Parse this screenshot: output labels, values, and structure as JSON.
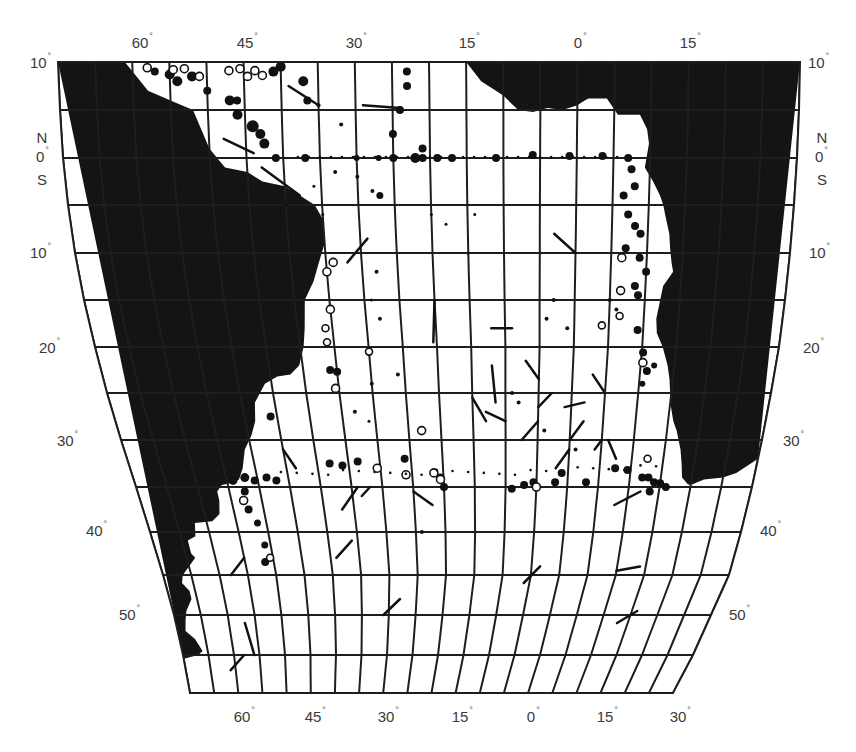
{
  "map": {
    "type": "Atlantic Ocean station map",
    "region": "South Atlantic (10°N to 60°S, 70°W to 30°E)",
    "colors": {
      "land": "#141414",
      "ocean": "#ffffff",
      "grid": "#1e1e1e",
      "label": "#3a3a3a"
    },
    "grid_spacing_deg": 5,
    "top_longitude_labels": [
      {
        "text": "60",
        "x": 140
      },
      {
        "text": "45",
        "x": 245
      },
      {
        "text": "30",
        "x": 354
      },
      {
        "text": "15",
        "x": 467
      },
      {
        "text": "0",
        "x": 578
      },
      {
        "text": "15",
        "x": 688
      }
    ],
    "bottom_longitude_labels": [
      {
        "text": "60",
        "x": 242
      },
      {
        "text": "45",
        "x": 313
      },
      {
        "text": "30",
        "x": 386
      },
      {
        "text": "15",
        "x": 460
      },
      {
        "text": "0",
        "x": 531
      },
      {
        "text": "15",
        "x": 605
      },
      {
        "text": "30",
        "x": 678
      }
    ],
    "left_latitude_labels": [
      {
        "text": "10",
        "y": 68,
        "x": 30
      },
      {
        "text": "0",
        "y": 162,
        "x": 36
      },
      {
        "text": "10",
        "y": 258,
        "x": 30
      },
      {
        "text": "20",
        "y": 353,
        "x": 39
      },
      {
        "text": "30",
        "y": 446,
        "x": 57
      },
      {
        "text": "40",
        "y": 536,
        "x": 86
      },
      {
        "text": "50",
        "y": 620,
        "x": 119
      }
    ],
    "right_latitude_labels": [
      {
        "text": "10",
        "y": 68,
        "x": 808
      },
      {
        "text": "0",
        "y": 162,
        "x": 815
      },
      {
        "text": "10",
        "y": 258,
        "x": 809
      },
      {
        "text": "20",
        "y": 353,
        "x": 803
      },
      {
        "text": "30",
        "y": 446,
        "x": 783
      },
      {
        "text": "40",
        "y": 536,
        "x": 760
      },
      {
        "text": "50",
        "y": 620,
        "x": 729
      }
    ],
    "hemisphere_labels": {
      "north": "N",
      "south": "S"
    },
    "legend": "none",
    "markers": {
      "filled_circles": "sampling stations (filled)",
      "open_circles": "sampling stations (open)",
      "small_dots": "minor stations",
      "line_segments": "drift/track vectors"
    }
  }
}
